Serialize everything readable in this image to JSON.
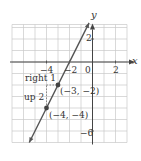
{
  "chart_data": {
    "type": "line",
    "title": "",
    "xlabel": "x",
    "ylabel": "y",
    "xlim": [
      -7,
      3
    ],
    "ylim": [
      -7,
      3
    ],
    "grid": true,
    "x_tick_labels": [
      "-4",
      "-2",
      "0",
      "2"
    ],
    "y_tick_labels": [
      "2",
      "-6"
    ],
    "series": [
      {
        "name": "y = 2x + 4",
        "type": "line",
        "slope": 2,
        "intercept": 4,
        "x": [
          -5.5,
          -0.3
        ],
        "y": [
          -7,
          3.4
        ],
        "color": "#555555"
      }
    ],
    "points": [
      {
        "x": -3,
        "y": -2,
        "label": "(−3, −2)"
      },
      {
        "x": -4,
        "y": -4,
        "label": "(−4, −4)"
      }
    ],
    "annotations": [
      {
        "text": "right 1",
        "type": "run"
      },
      {
        "text": "up 2",
        "type": "rise"
      }
    ]
  },
  "labels": {
    "x_axis": "x",
    "y_axis": "y",
    "tick_x_neg4": "−4",
    "tick_x_neg2": "−2",
    "tick_origin": "0",
    "tick_x_2": "2",
    "tick_y_2": "2",
    "tick_y_neg6": "−6",
    "point1": "(−3, −2)",
    "point2": "(−4, −4)",
    "run": "right 1",
    "rise": "up 2"
  },
  "colors": {
    "grid": "#c8c8c8",
    "axis": "#444444",
    "line": "#555555",
    "point": "#444444"
  }
}
